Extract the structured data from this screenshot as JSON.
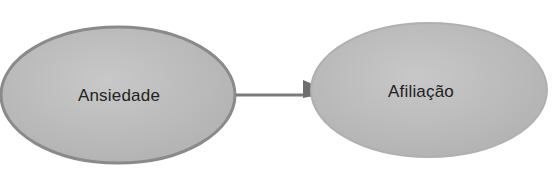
{
  "diagram": {
    "type": "flow",
    "nodes": [
      {
        "id": "ansiedade",
        "label": "Ansiedade"
      },
      {
        "id": "afiliacao",
        "label": "Afiliação"
      }
    ],
    "edges": [
      {
        "from": "ansiedade",
        "to": "afiliacao"
      }
    ],
    "colors": {
      "node_fill": "#bdbdbd",
      "node_border": "#8a8a8a",
      "arrow": "#7a7a7a"
    }
  }
}
